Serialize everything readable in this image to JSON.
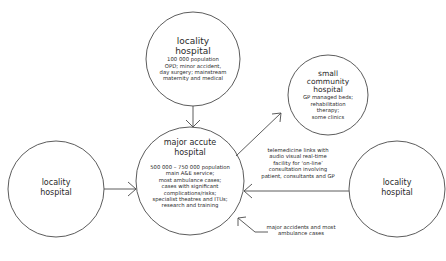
{
  "diagram": {
    "nodes": [
      {
        "id": "top",
        "title": "locality hospital",
        "title_lines": [
          "locality",
          "hospital"
        ],
        "desc_lines": [
          "100 000 population",
          "OPD; minor accident,",
          "day surgery; mainstream",
          "maternity and medical"
        ]
      },
      {
        "id": "small",
        "title_lines": [
          "small",
          "community",
          "hospital"
        ],
        "desc_lines": [
          "GP managed beds;",
          "rehabilitation",
          "therapy;",
          "some clinics"
        ]
      },
      {
        "id": "center",
        "title_lines": [
          "major accute",
          "hospital"
        ],
        "desc_lines": [
          "500 000 – 750 000 population",
          "main A&E service;",
          "most ambulance cases;",
          "cases with significant",
          "complications/risks;",
          "specialist theatres and ITUs;",
          "research and training"
        ]
      },
      {
        "id": "left",
        "title_lines": [
          "locality",
          "hospital"
        ],
        "desc_lines": []
      },
      {
        "id": "right",
        "title_lines": [
          "locality",
          "hospital"
        ],
        "desc_lines": []
      }
    ],
    "notes": {
      "telemedicine": [
        "telemedicine links with",
        "audio visual real-time",
        "facility for ‘on-line’",
        "consultation involving",
        "patient, consultants and GP"
      ],
      "accidents": [
        "major accidents and most",
        "ambulance cases"
      ]
    },
    "colors": {
      "stroke": "#4a4a4a",
      "text": "#2a2a2a",
      "background": "#ffffff"
    }
  }
}
